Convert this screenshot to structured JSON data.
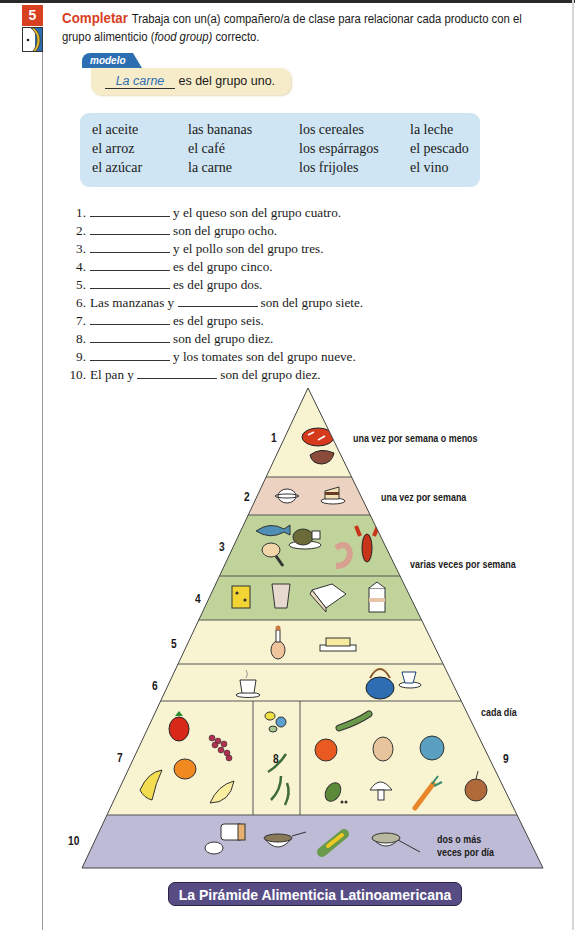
{
  "activity": {
    "number": "5",
    "title": "Completar",
    "instructions_before_italic": "Trabaja con un(a) compañero/a de clase para relacionar cada producto con el grupo alimenticio (",
    "instructions_italic": "food group)",
    "instructions_after_italic": " correcto."
  },
  "modelo": {
    "tab_label": "modelo",
    "answer": "La carne",
    "sentence_rest": "es del grupo uno."
  },
  "word_bank": {
    "columns": [
      [
        "el aceite",
        "el arroz",
        "el azúcar"
      ],
      [
        "las bananas",
        "el café",
        "la carne"
      ],
      [
        "los cereales",
        "los espárragos",
        "los frijoles"
      ],
      [
        "la leche",
        "el pescado",
        "el vino"
      ]
    ],
    "rows": [
      [
        "el aceite",
        "las bananas",
        "los cereales",
        "la leche"
      ],
      [
        "el arroz",
        "el café",
        "los espárragos",
        "el pescado"
      ],
      [
        "el azúcar",
        "la carne",
        "los frijoles",
        "el vino"
      ]
    ]
  },
  "items": [
    {
      "num": "1.",
      "before": "",
      "after": "y el queso son del grupo cuatro."
    },
    {
      "num": "2.",
      "before": "",
      "after": "son del grupo ocho."
    },
    {
      "num": "3.",
      "before": "",
      "after": "y el pollo son del grupo tres."
    },
    {
      "num": "4.",
      "before": "",
      "after": "es del grupo cinco."
    },
    {
      "num": "5.",
      "before": "",
      "after": "es del grupo dos."
    },
    {
      "num": "6.",
      "before": "Las manzanas y",
      "after": "son del grupo siete."
    },
    {
      "num": "7.",
      "before": "",
      "after": "es del grupo seis."
    },
    {
      "num": "8.",
      "before": "",
      "after": "son del grupo diez."
    },
    {
      "num": "9.",
      "before": "",
      "after": "y los tomates son del grupo nueve."
    },
    {
      "num": "10.",
      "before": "El pan y",
      "after": "son del grupo diez."
    }
  ],
  "pyramid": {
    "title": "La Pirámide Alimenticia Latinoamericana",
    "group_numbers": [
      "1",
      "2",
      "3",
      "4",
      "5",
      "6",
      "7",
      "8",
      "9",
      "10"
    ],
    "frequency_labels": {
      "group1": "una vez por semana o menos",
      "group2": "una vez por semana",
      "group3_4": "varias veces por semana",
      "group5_9": "cada día",
      "group10_line1": "dos o más",
      "group10_line2": "veces por día"
    },
    "colors": {
      "cream": "#f8f4d2",
      "pink": "#ecd2c1",
      "green": "#bfd39a",
      "lavender": "#bebbd6",
      "title_bg": "#574d84",
      "accent_red": "#d8401f",
      "accent_blue": "#2d6eb3"
    },
    "band_icons": {
      "1": [
        "steak-icon",
        "pork-chop-icon"
      ],
      "2": [
        "sugar-bowl-icon",
        "cake-icon"
      ],
      "3": [
        "fish-icon",
        "roast-chicken-icon",
        "chicken-leg-icon",
        "shrimp-icon",
        "lobster-icon"
      ],
      "4": [
        "cheese-icon",
        "yogurt-cup-icon",
        "egg-carton-icon",
        "milk-carton-icon"
      ],
      "5": [
        "oil-bottle-icon",
        "butter-icon"
      ],
      "6": [
        "coffee-cup-icon",
        "teapot-icon",
        "tea-cup-icon"
      ],
      "7": [
        "apple-icon",
        "grapes-icon",
        "orange-icon",
        "banana-icon",
        "melon-slice-icon"
      ],
      "8": [
        "beans-icon",
        "green-beans-icon"
      ],
      "9": [
        "cucumber-icon",
        "tomato-icon",
        "potato-icon",
        "cabbage-icon",
        "peas-icon",
        "mushroom-icon",
        "carrot-icon",
        "onion-icon"
      ],
      "10": [
        "bread-icon",
        "cereal-bowl-icon",
        "corn-icon",
        "rice-bowl-icon"
      ]
    }
  }
}
